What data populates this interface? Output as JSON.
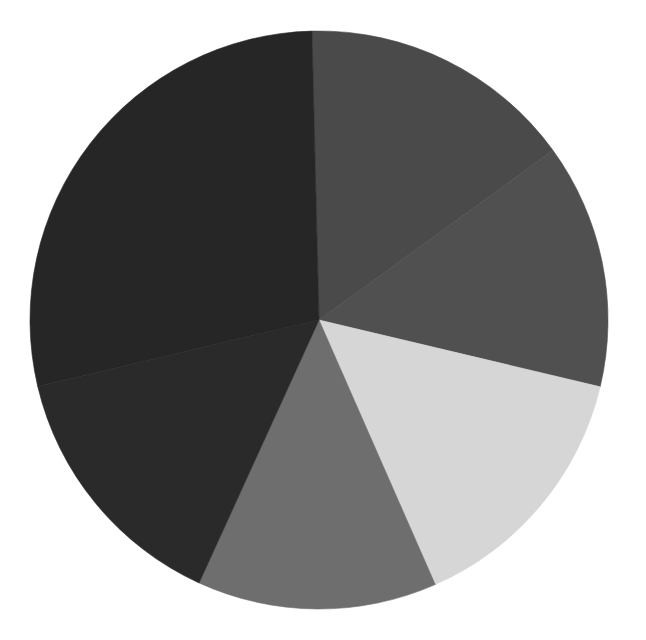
{
  "chart_data": {
    "type": "pie",
    "title": "",
    "title_note": "title text cut off at top edge, illegible",
    "center": [
      319,
      320
    ],
    "radius": 289,
    "start_angle_deg": -1.4,
    "direction": "clockwise",
    "legend": "none",
    "slices": [
      {
        "label": "",
        "value": 15.4,
        "color": "#4a4a4a"
      },
      {
        "label": "",
        "value": 13.7,
        "color": "#505050"
      },
      {
        "label": "",
        "value": 14.7,
        "color": "#d6d6d6"
      },
      {
        "label": "",
        "value": 13.4,
        "color": "#6e6e6e"
      },
      {
        "label": "",
        "value": 14.5,
        "color": "#2a2a2a"
      },
      {
        "label": "",
        "value": 28.3,
        "color": "#262626"
      }
    ]
  }
}
